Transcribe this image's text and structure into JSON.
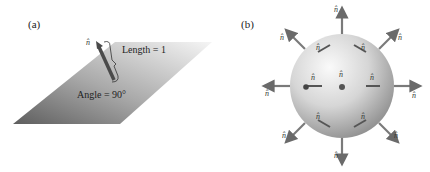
{
  "panel_a": {
    "label": "(a)",
    "length_label": "Length = 1",
    "angle_label": "Angle = 90°",
    "normal_label": "n̂"
  },
  "panel_b": {
    "label": "(b)",
    "normal_label": "n̂"
  },
  "colors": {
    "plane_dark": "#6e6e6e",
    "plane_light": "#f2f2f2",
    "sphere_light": "#f4f4f4",
    "sphere_dark": "#8c8c8c",
    "arrow": "#7a7a7a",
    "text": "#222222"
  }
}
